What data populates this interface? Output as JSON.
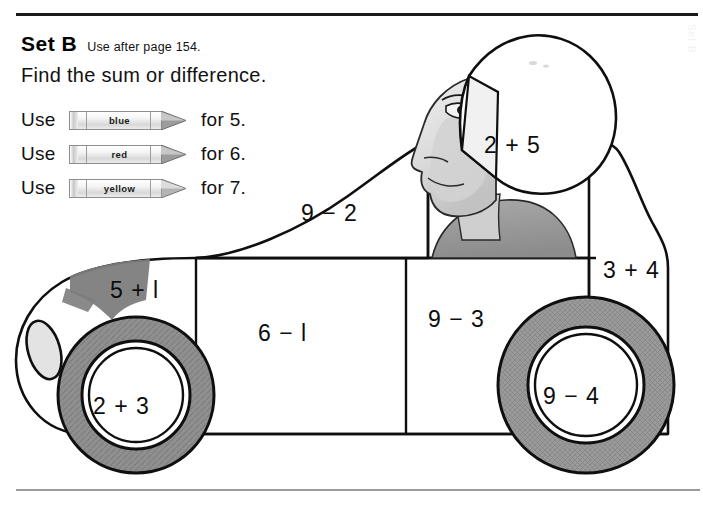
{
  "worksheet": {
    "set_label": "Set B",
    "set_note": "Use after page 154.",
    "instruction": "Find the sum or difference."
  },
  "legend": {
    "use_word": "Use",
    "items": [
      {
        "crayon_label": "blue",
        "for_text": "for 5."
      },
      {
        "crayon_label": "red",
        "for_text": "for 6."
      },
      {
        "crayon_label": "yellow",
        "for_text": "for 7."
      }
    ]
  },
  "car": {
    "regions": {
      "helmet": "2 + 5",
      "hood": "9 − 2",
      "rear_panel": "3 + 4",
      "front_fender": "5 + l",
      "door": "6 − l",
      "rear_door": "9 − 3",
      "front_wheel": "2 + 3",
      "rear_wheel": "9 − 4"
    }
  },
  "margin": {
    "ghost_text": "Set B"
  },
  "colors": {
    "ink": "#111111",
    "rule_top": "#1a1a1a",
    "rule_bottom": "#9a9a9a",
    "tire_gray": "#8e8e8e",
    "shade_gray": "#7d7d7d",
    "skin_gray": "#dcdcdc",
    "paper": "#ffffff"
  }
}
